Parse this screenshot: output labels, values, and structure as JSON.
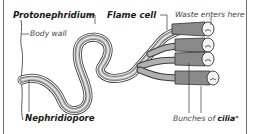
{
  "diagram": {
    "type": "anatomy-diagram",
    "labels": {
      "protonephridium": "Protonephridium",
      "flame_cell": "Flame cell",
      "waste": "Waste enters here",
      "body_wall": "Body wall",
      "nephridiopore": "Nephridiopore",
      "cilia_prefix": "Bunches of ",
      "cilia_bold": "cilia",
      "cilia_suffix": "*"
    },
    "colors": {
      "outline": "#3a3a3a",
      "tube_outer": "#9a9a9a",
      "tube_inner": "#e6e6e6",
      "frame": "#6e6e6e"
    }
  }
}
